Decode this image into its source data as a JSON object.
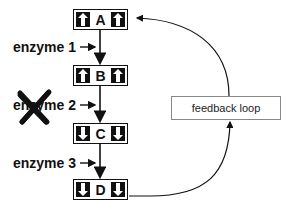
{
  "nodes": [
    {
      "id": "A",
      "label": "A",
      "arrow_direction": "up"
    },
    {
      "id": "B",
      "label": "B",
      "arrow_direction": "up"
    },
    {
      "id": "C",
      "label": "C",
      "arrow_direction": "down"
    },
    {
      "id": "D",
      "label": "D",
      "arrow_direction": "down"
    }
  ],
  "enzymes": [
    {
      "label": "enzyme 1",
      "inhibited": false
    },
    {
      "label": "enzyme 2",
      "inhibited": true
    },
    {
      "label": "enzyme 3",
      "inhibited": false
    }
  ],
  "feedback": {
    "label": "feedback loop"
  },
  "colors": {
    "ink": "#111111",
    "box_border": "#888888",
    "background": "#ffffff"
  }
}
